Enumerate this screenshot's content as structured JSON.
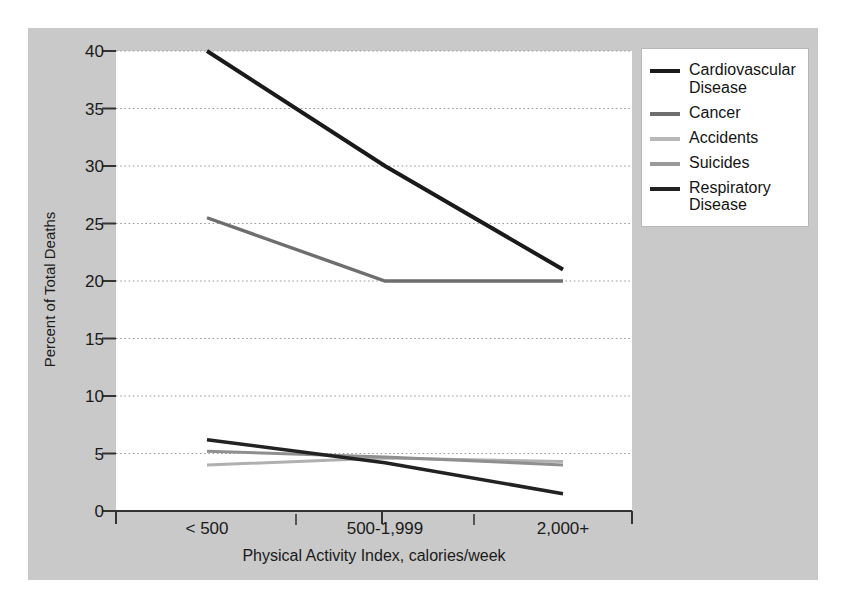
{
  "chart_data": {
    "type": "line",
    "title": "",
    "xlabel": "Physical Activity Index, calories/week",
    "ylabel": "Percent of Total Deaths",
    "categories": [
      "< 500",
      "500-1,999",
      "2,000+"
    ],
    "ylim": [
      0,
      40
    ],
    "ytick_values": [
      0,
      5,
      10,
      15,
      20,
      25,
      30,
      35,
      40
    ],
    "ytick_labels": [
      "0",
      "5",
      "10",
      "15",
      "20",
      "25",
      "30",
      "35",
      "40"
    ],
    "grid": true,
    "grid_style": "dotted-horizontal",
    "legend_position": "top-right-outside",
    "series": [
      {
        "name": "Cardiovascular Disease",
        "color": "#1a1a1a",
        "width": 4.0,
        "values": [
          40.0,
          30.0,
          21.0
        ]
      },
      {
        "name": "Cancer",
        "color": "#6e6e6e",
        "width": 3.4,
        "values": [
          25.5,
          20.0,
          20.0
        ]
      },
      {
        "name": "Accidents",
        "color": "#b0b0b0",
        "width": 3.0,
        "values": [
          4.0,
          4.6,
          4.3
        ]
      },
      {
        "name": "Suicides",
        "color": "#8f8f8f",
        "width": 3.0,
        "values": [
          5.2,
          4.7,
          4.0
        ]
      },
      {
        "name": "Respiratory Disease",
        "color": "#222222",
        "width": 3.6,
        "values": [
          6.2,
          4.2,
          1.5
        ]
      }
    ]
  },
  "axes": {
    "y_title": "Percent of Total Deaths",
    "x_title": "Physical Activity Index, calories/week",
    "y_labels": [
      "40",
      "35",
      "30",
      "25",
      "20",
      "15",
      "10",
      "5",
      "0"
    ],
    "x_labels": [
      "< 500",
      "500-1,999",
      "2,000+"
    ]
  },
  "legend": {
    "items": [
      {
        "label": "Cardiovascular Disease",
        "color": "#1a1a1a"
      },
      {
        "label": "Cancer",
        "color": "#6e6e6e"
      },
      {
        "label": "Accidents",
        "color": "#b8b8b8"
      },
      {
        "label": "Suicides",
        "color": "#9a9a9a"
      },
      {
        "label": "Respiratory Disease",
        "color": "#222222"
      }
    ]
  },
  "colors": {
    "panel_background": "#c9c9c9",
    "plot_background": "#ffffff",
    "page_background": "#ffffff",
    "grid": "#9a9a9a",
    "axis": "#333333",
    "text": "#1a1a1a"
  }
}
